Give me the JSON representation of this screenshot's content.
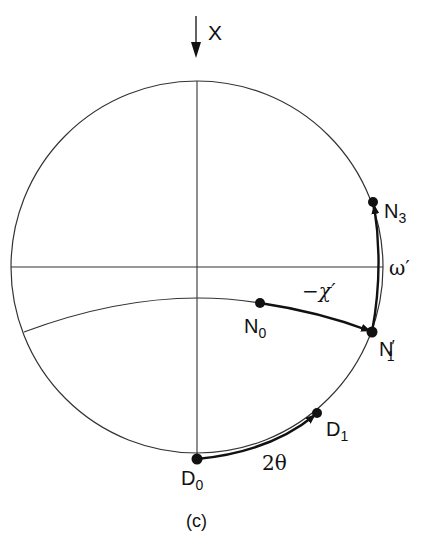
{
  "figure": {
    "caption": "(c)",
    "beam_label": "X",
    "points": {
      "N0": {
        "main": "N",
        "sub": "0"
      },
      "N1p": {
        "main": "N",
        "sub": "1",
        "prime": "′"
      },
      "N3": {
        "main": "N",
        "sub": "3"
      },
      "D0": {
        "main": "D",
        "sub": "0"
      },
      "D1": {
        "main": "D",
        "sub": "1"
      }
    },
    "rotations": {
      "chi": "−χ′",
      "omega": "ω′",
      "two_theta": "2θ"
    }
  }
}
